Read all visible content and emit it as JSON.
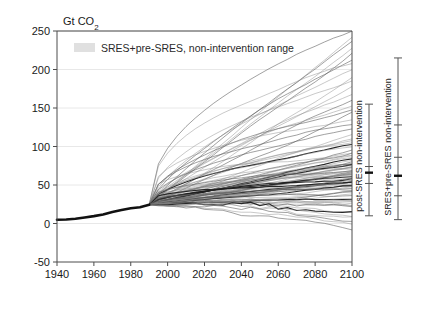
{
  "chart_data": {
    "type": "line",
    "title": "",
    "unit_title": "Gt CO2",
    "unit_title_main": "Gt CO",
    "unit_title_sub": "2",
    "xlabel": "",
    "ylabel": "",
    "xlim": [
      1940,
      2100
    ],
    "ylim": [
      -50,
      250
    ],
    "xticks": [
      1940,
      1960,
      1980,
      2000,
      2020,
      2040,
      2060,
      2080,
      2100
    ],
    "xtick_labels": [
      "1940",
      "1960",
      "1980",
      "2000",
      "2020",
      "2040",
      "2060",
      "2080",
      "2100"
    ],
    "yticks": [
      -50,
      0,
      50,
      100,
      150,
      200,
      250
    ],
    "ytick_labels": [
      "-50",
      "0",
      "50",
      "100",
      "150",
      "200",
      "250"
    ],
    "grid": true,
    "legend": {
      "position": "top-left-inside",
      "entries": [
        {
          "label": "SRES+pre-SRES, non-intervention range",
          "swatch_color": "#e0e0e0",
          "type": "band"
        }
      ]
    },
    "historical": {
      "name": "Historical emissions",
      "color": "#1a1a1a",
      "x": [
        1940,
        1945,
        1950,
        1955,
        1960,
        1965,
        1970,
        1975,
        1980,
        1985,
        1990
      ],
      "y": [
        4.8,
        5.2,
        6.2,
        7.8,
        9.6,
        11.8,
        15.0,
        17.6,
        19.8,
        21.2,
        24.5
      ]
    },
    "scenario_branch_year": 1990,
    "scenario_branch_value": 24.5,
    "series_summary": {
      "count": 90,
      "color": "#4a4a4a",
      "description": "Non-intervention emission scenario trajectories, 1990-2100",
      "value_2100_min": -8,
      "value_2100_max": 250,
      "value_2100_median": 62,
      "dense_band_2100": [
        30,
        100
      ]
    },
    "endpoints_2100": [
      250,
      243,
      236,
      228,
      221,
      214,
      206,
      199,
      192,
      184,
      177,
      170,
      162,
      155,
      148,
      141,
      134,
      128,
      122,
      117,
      112,
      108,
      104,
      101,
      98,
      95,
      93,
      91,
      89,
      87,
      85,
      84,
      82,
      81,
      80,
      79,
      78,
      77,
      76,
      75,
      74,
      73,
      72,
      71,
      70,
      69,
      68,
      67,
      66,
      65,
      64,
      63,
      62,
      61,
      60,
      59,
      58,
      57,
      56,
      55,
      54,
      53,
      52,
      51,
      50,
      49,
      48,
      46,
      45,
      44,
      42,
      41,
      39,
      38,
      36,
      34,
      32,
      30,
      28,
      26,
      24,
      21,
      19,
      16,
      13,
      10,
      7,
      3,
      -2,
      -8
    ],
    "right_ranges": [
      {
        "name": "post-SRES non-intervention",
        "label": "post-SRES non-intervention",
        "min": 10,
        "max": 155,
        "ticks": [
          10,
          52,
          66,
          74,
          155
        ],
        "bold_ticks": [
          66
        ],
        "color": "#555555"
      },
      {
        "name": "SRES+pre-SRES non-intervention",
        "label": "SRES+pre-SRES non-intervention",
        "min": 5,
        "max": 215,
        "ticks": [
          5,
          36,
          62,
          86,
          128,
          215
        ],
        "bold_ticks": [
          62
        ],
        "color": "#555555"
      }
    ]
  },
  "colors": {
    "axis": "#4d4d4d",
    "grid": "#e8e8e8",
    "text": "#1a1a1a",
    "lines": "#555555",
    "historical": "#111111",
    "legend_swatch": "#e0e0e0"
  }
}
